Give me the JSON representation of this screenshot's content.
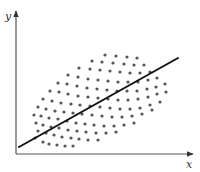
{
  "chart_data": {
    "type": "scatter",
    "title": "",
    "xlabel": "x",
    "ylabel": "y",
    "grid": false,
    "legend": null,
    "origin_px": [
      16,
      154
    ],
    "xlim": [
      0,
      176
    ],
    "ylim": [
      0,
      142
    ],
    "axis_color": "#555555",
    "point_color": "#555555",
    "line_color": "#111111",
    "regression_line": {
      "x1": 3,
      "y1": 7,
      "x2": 162,
      "y2": 96
    },
    "series": [
      {
        "name": "points",
        "points": [
          [
            19,
            16
          ],
          [
            27,
            12
          ],
          [
            33,
            10
          ],
          [
            41,
            9
          ],
          [
            49,
            8
          ],
          [
            57,
            8
          ],
          [
            22,
            23
          ],
          [
            30,
            21
          ],
          [
            38,
            19
          ],
          [
            46,
            17
          ],
          [
            55,
            16
          ],
          [
            63,
            15
          ],
          [
            72,
            14
          ],
          [
            82,
            14
          ],
          [
            20,
            31
          ],
          [
            27,
            29
          ],
          [
            35,
            27
          ],
          [
            43,
            26
          ],
          [
            52,
            24
          ],
          [
            61,
            23
          ],
          [
            70,
            22
          ],
          [
            80,
            21
          ],
          [
            90,
            21
          ],
          [
            100,
            22
          ],
          [
            18,
            39
          ],
          [
            25,
            38
          ],
          [
            33,
            36
          ],
          [
            42,
            35
          ],
          [
            51,
            33
          ],
          [
            60,
            31
          ],
          [
            69,
            30
          ],
          [
            78,
            29
          ],
          [
            88,
            28
          ],
          [
            98,
            28
          ],
          [
            108,
            29
          ],
          [
            118,
            31
          ],
          [
            22,
            47
          ],
          [
            30,
            45
          ],
          [
            39,
            43
          ],
          [
            48,
            42
          ],
          [
            57,
            41
          ],
          [
            66,
            40
          ],
          [
            76,
            39
          ],
          [
            86,
            38
          ],
          [
            96,
            37
          ],
          [
            106,
            37
          ],
          [
            116,
            38
          ],
          [
            126,
            40
          ],
          [
            136,
            44
          ],
          [
            27,
            55
          ],
          [
            36,
            53
          ],
          [
            45,
            51
          ],
          [
            55,
            50
          ],
          [
            64,
            49
          ],
          [
            74,
            48
          ],
          [
            84,
            47
          ],
          [
            94,
            46
          ],
          [
            104,
            45
          ],
          [
            114,
            45
          ],
          [
            124,
            46
          ],
          [
            134,
            49
          ],
          [
            144,
            52
          ],
          [
            34,
            63
          ],
          [
            43,
            62
          ],
          [
            52,
            60
          ],
          [
            62,
            58
          ],
          [
            72,
            57
          ],
          [
            82,
            56
          ],
          [
            92,
            55
          ],
          [
            102,
            54
          ],
          [
            112,
            54
          ],
          [
            122,
            55
          ],
          [
            132,
            57
          ],
          [
            141,
            60
          ],
          [
            150,
            62
          ],
          [
            42,
            71
          ],
          [
            51,
            70
          ],
          [
            61,
            68
          ],
          [
            71,
            66
          ],
          [
            81,
            65
          ],
          [
            91,
            64
          ],
          [
            101,
            63
          ],
          [
            111,
            63
          ],
          [
            121,
            63
          ],
          [
            131,
            65
          ],
          [
            140,
            67
          ],
          [
            149,
            70
          ],
          [
            52,
            79
          ],
          [
            62,
            77
          ],
          [
            72,
            75
          ],
          [
            82,
            74
          ],
          [
            92,
            73
          ],
          [
            102,
            72
          ],
          [
            112,
            72
          ],
          [
            122,
            72
          ],
          [
            132,
            74
          ],
          [
            141,
            76
          ],
          [
            63,
            86
          ],
          [
            74,
            85
          ],
          [
            84,
            84
          ],
          [
            94,
            83
          ],
          [
            104,
            82
          ],
          [
            114,
            81
          ],
          [
            124,
            81
          ],
          [
            134,
            82
          ],
          [
            76,
            93
          ],
          [
            86,
            92
          ],
          [
            97,
            91
          ],
          [
            108,
            90
          ],
          [
            118,
            89
          ],
          [
            128,
            89
          ],
          [
            89,
            99
          ],
          [
            100,
            98
          ],
          [
            111,
            97
          ],
          [
            121,
            96
          ]
        ]
      }
    ]
  }
}
